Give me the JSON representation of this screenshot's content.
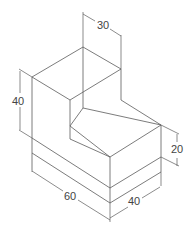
{
  "drawing": {
    "type": "isometric-L-block",
    "line_color": "#5a5a5a",
    "text_color": "#444444",
    "background": "#ffffff"
  },
  "dimensions": {
    "top_width": "30",
    "upper_height": "40",
    "lower_height": "20",
    "length": "60",
    "depth": "40"
  }
}
